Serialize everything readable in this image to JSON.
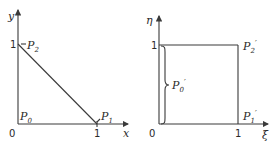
{
  "left_panel": {
    "y_axis_label": "y",
    "x_axis_label": "x",
    "origin_label": "0",
    "y_tick_label": "1",
    "x_tick_label": "1",
    "points": {
      "p0": "P",
      "p0_sub": "0",
      "p1": "P",
      "p1_sub": "1",
      "p2": "P",
      "p2_sub": "2"
    }
  },
  "right_panel": {
    "y_axis_label": "η",
    "x_axis_label": "ξ",
    "origin_label": "0",
    "y_tick_label": "1",
    "x_tick_label": "1",
    "points": {
      "p0": "P",
      "p0_sub": "0",
      "p0_prime": "′",
      "p1": "P",
      "p1_sub": "1",
      "p1_prime": "′",
      "p2": "P",
      "p2_sub": "2",
      "p2_prime": "′"
    }
  }
}
